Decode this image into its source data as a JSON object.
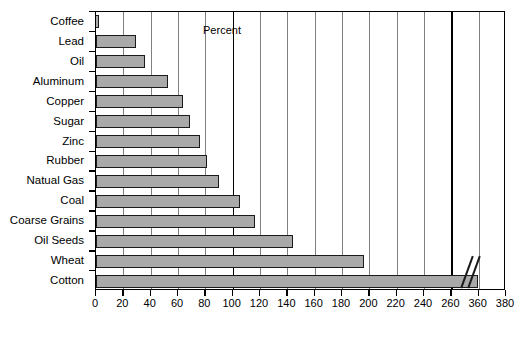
{
  "chart_data": {
    "type": "bar",
    "orientation": "horizontal",
    "title": "",
    "xlabel": "Percent",
    "ylabel": "",
    "categories": [
      "Coffee",
      "Lead",
      "Oil",
      "Aluminum",
      "Copper",
      "Sugar",
      "Zinc",
      "Rubber",
      "Natual Gas",
      "Coal",
      "Coarse Grains",
      "Oil Seeds",
      "Wheat",
      "Cotton"
    ],
    "values": [
      2,
      29,
      36,
      53,
      64,
      69,
      76,
      81,
      90,
      105,
      116,
      144,
      196,
      358
    ],
    "xticks": [
      0,
      20,
      40,
      60,
      80,
      100,
      120,
      140,
      160,
      180,
      200,
      220,
      240,
      260,
      360,
      380
    ],
    "xlim": [
      0,
      380
    ],
    "axis_break": {
      "from": 260,
      "to": 360,
      "present": true
    },
    "grid": "vertical",
    "legend": "none",
    "bar_color": "#a9a9a9",
    "bar_edge_color": "#1a1a1a",
    "grid_color": "#808080",
    "major_grid_color": "#000000",
    "background": "#ffffff"
  },
  "axis": {
    "x_title": "Percent"
  }
}
